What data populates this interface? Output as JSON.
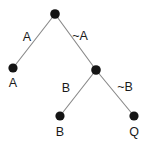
{
  "diagram": {
    "type": "tree",
    "canvas": {
      "width": 147,
      "height": 145,
      "background": "#ffffff"
    },
    "style": {
      "node_color": "#141414",
      "edge_color": "#8a8a8a",
      "text_color": "#1a1a1a",
      "node_radius": 4.6,
      "edge_width": 1.15
    },
    "nodes": [
      {
        "id": "root",
        "label": "",
        "x": 55,
        "y": 14,
        "kind": "internal"
      },
      {
        "id": "leaf-a",
        "label": "A",
        "x": 13,
        "y": 68,
        "kind": "leaf",
        "label_x": 13,
        "label_y": 87
      },
      {
        "id": "middle",
        "label": "",
        "x": 96,
        "y": 70,
        "kind": "internal"
      },
      {
        "id": "leaf-b",
        "label": "B",
        "x": 60,
        "y": 116,
        "kind": "leaf",
        "label_x": 60,
        "label_y": 136
      },
      {
        "id": "leaf-q",
        "label": "Q",
        "x": 134,
        "y": 116,
        "kind": "leaf",
        "label_x": 134,
        "label_y": 136
      }
    ],
    "edges": [
      {
        "id": "root-to-leaf-a",
        "from": "root",
        "to": "leaf-a",
        "label": "A",
        "label_x": 27,
        "label_y": 41
      },
      {
        "id": "root-to-middle",
        "from": "root",
        "to": "middle",
        "label": "~A",
        "label_x": 80,
        "label_y": 40
      },
      {
        "id": "middle-to-leaf-b",
        "from": "middle",
        "to": "leaf-b",
        "label": "B",
        "label_x": 66,
        "label_y": 92
      },
      {
        "id": "middle-to-leaf-q",
        "from": "middle",
        "to": "leaf-q",
        "label": "~B",
        "label_x": 125,
        "label_y": 91
      }
    ]
  }
}
